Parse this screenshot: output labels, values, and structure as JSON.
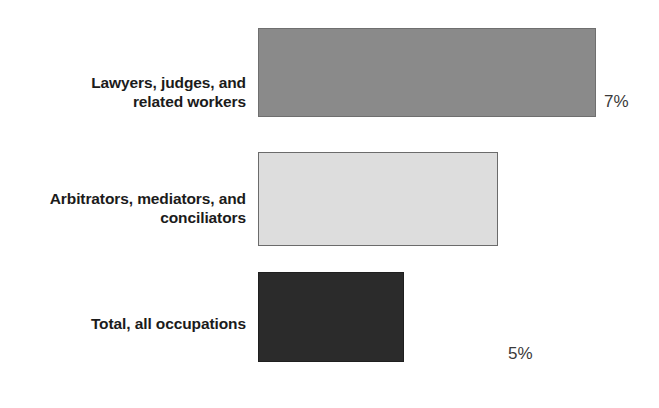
{
  "chart_data": {
    "type": "bar",
    "orientation": "horizontal",
    "title": "",
    "subtitle": "",
    "xlabel": "",
    "ylabel": "",
    "categories": [
      "Lawyers, judges, and\nrelated workers",
      "Arbitrators, mediators, and\nconciliators",
      "Total, all occupations"
    ],
    "values": [
      7,
      5,
      3
    ],
    "value_labels": [
      "7%",
      "5%",
      "3%"
    ],
    "unit": "percent",
    "xlim": [
      0,
      7
    ],
    "grid": false,
    "legend": null,
    "series": [
      {
        "name": "Projected percent change in employment",
        "values": [
          7,
          5,
          3
        ]
      }
    ],
    "bar_colors": [
      "#8a8a8a",
      "#dddddd",
      "#2b2b2b"
    ],
    "bar_border_colors": [
      "#6f6f6f",
      "#6b6b6b",
      "#1f1f1f"
    ],
    "label_text_color": "#1b1b1b",
    "value_text_color": "#3a3a3a",
    "background_color": "#ffffff",
    "bars": [
      {
        "category": "Lawyers, judges, and\nrelated workers",
        "value": 7,
        "value_label": "7%",
        "color": "#8a8a8a"
      },
      {
        "category": "Arbitrators, mediators, and\nconciliators",
        "value": 5,
        "value_label": "5%",
        "color": "#dddddd"
      },
      {
        "category": "Total, all occupations",
        "value": 3,
        "value_label": "3%",
        "color": "#2b2b2b"
      }
    ]
  }
}
